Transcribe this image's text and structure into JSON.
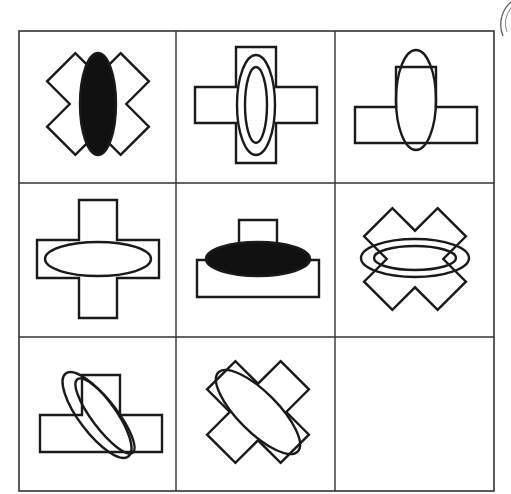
{
  "puzzle": {
    "type": "3x3 matrix reasoning",
    "rows": 3,
    "cols": 3,
    "line_color": "#1a1a1a",
    "fill_color": "#111111",
    "cells": [
      {
        "row": 1,
        "col": 1,
        "base": "x-cross",
        "ellipse": "vertical",
        "ellipse_style": "filled",
        "ellipse_count": 1
      },
      {
        "row": 1,
        "col": 2,
        "base": "plus-cross",
        "ellipse": "vertical",
        "ellipse_style": "outline",
        "ellipse_count": 2
      },
      {
        "row": 1,
        "col": 3,
        "base": "t-shape",
        "ellipse": "vertical",
        "ellipse_style": "outline",
        "ellipse_count": 1
      },
      {
        "row": 2,
        "col": 1,
        "base": "plus-cross",
        "ellipse": "horizontal",
        "ellipse_style": "outline",
        "ellipse_count": 1
      },
      {
        "row": 2,
        "col": 2,
        "base": "t-shape",
        "ellipse": "horizontal",
        "ellipse_style": "filled",
        "ellipse_count": 1
      },
      {
        "row": 2,
        "col": 3,
        "base": "x-cross",
        "ellipse": "horizontal",
        "ellipse_style": "outline",
        "ellipse_count": 2
      },
      {
        "row": 3,
        "col": 1,
        "base": "t-shape",
        "ellipse": "diagonal",
        "ellipse_style": "outline",
        "ellipse_count": 2
      },
      {
        "row": 3,
        "col": 2,
        "base": "x-cross",
        "ellipse": "diagonal",
        "ellipse_style": "outline",
        "ellipse_count": 1
      },
      {
        "row": 3,
        "col": 3,
        "base": "empty",
        "ellipse": "none",
        "ellipse_style": "none",
        "ellipse_count": 0
      }
    ],
    "missing_cell": {
      "row": 3,
      "col": 3
    }
  }
}
